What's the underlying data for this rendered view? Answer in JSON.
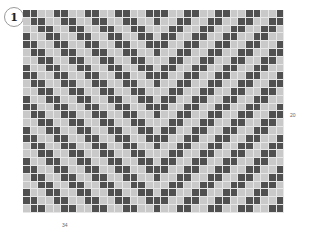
{
  "figure": {
    "number_badge": "1"
  },
  "grid": {
    "columns": 34,
    "rows": 26,
    "colors": {
      "dark": "#505050",
      "light": "#c9c9c9",
      "gridline": "#e6e6e6"
    },
    "pattern": "chevron",
    "gridParams": {
      "center_col": 17,
      "stripe_rows": 2,
      "period": 4
    }
  },
  "labels": {
    "row_marker": "20",
    "column_marker": "34"
  }
}
